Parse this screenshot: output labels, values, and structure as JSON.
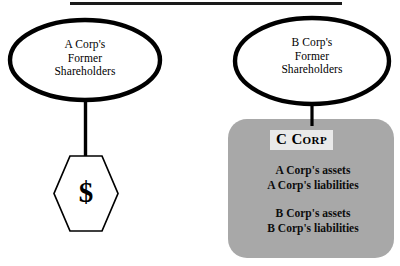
{
  "diagram": {
    "title_rule": "",
    "left_branch": {
      "entity": {
        "name": "a-corp-shareholders",
        "label": "A Corp's\nFormer\nShareholders"
      },
      "consideration": {
        "name": "cash-consideration",
        "symbol": "$"
      }
    },
    "right_branch": {
      "entity": {
        "name": "b-corp-shareholders",
        "label": "B Corp's\nFormer\nShareholders"
      },
      "surviving_corporation": {
        "title": "C Corp",
        "balance_sheet": {
          "group_a": [
            "A Corp's assets",
            "A Corp's liabilities"
          ],
          "group_b": [
            "B Corp's assets",
            "B Corp's liabilities"
          ]
        }
      }
    },
    "colors": {
      "stroke": "#000000",
      "box_fill": "#a8a8a8",
      "title_highlight": "#e9e9e9",
      "background": "#ffffff"
    }
  }
}
